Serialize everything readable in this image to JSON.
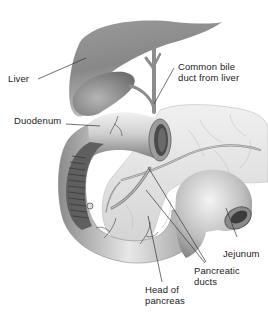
{
  "diagram": {
    "type": "anatomical-illustration",
    "labels": [
      {
        "id": "liver",
        "text": "Liver"
      },
      {
        "id": "bile",
        "line1": "Common bile",
        "line2": "duct from liver"
      },
      {
        "id": "duodenum",
        "text": "Duodenum"
      },
      {
        "id": "jejunum",
        "text": "Jejunum"
      },
      {
        "id": "ducts",
        "line1": "Pancreatic",
        "line2": "ducts"
      },
      {
        "id": "head",
        "line1": "Head of",
        "line2": "pancreas"
      }
    ],
    "colors": {
      "organ_dark": "#6e6e6e",
      "organ_mid": "#a8a8a8",
      "organ_light": "#e6e6e6",
      "leader_line": "#333333",
      "text": "#222222"
    }
  }
}
